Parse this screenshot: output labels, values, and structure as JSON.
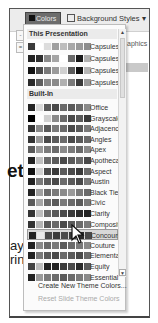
{
  "ribbon": {
    "colors_button": "Colors",
    "background_styles_button": "Background Styles",
    "graphics_partial": "aphics",
    "side_buttons": [
      "-",
      "="
    ]
  },
  "background_text": {
    "big": "et",
    "line1": "ayir",
    "line2": "ring"
  },
  "panel": {
    "section_this_presentation": "This Presentation",
    "section_built_in": "Built-In",
    "this_presentation": [
      {
        "label": "Capsules 1",
        "colors": [
          "#3a3a3a",
          "#ffffff",
          "#dcdcdc",
          "#a0a0a0",
          "#bdbdbd",
          "#a8a8a8",
          "#9a9a9a",
          "#8e8e8e"
        ]
      },
      {
        "label": "Capsules 2",
        "colors": [
          "#222222",
          "#2f2f2f",
          "#8a8a8a",
          "#a5a5a5",
          "#ffffff",
          "#6a6a6a",
          "#1a1a1a",
          "#b0b0b0"
        ]
      },
      {
        "label": "Capsules 3",
        "colors": [
          "#111111",
          "#4a4a4a",
          "#7a7a7a",
          "#9a9a9a",
          "#cfcfcf",
          "#5a5a5a",
          "#111111",
          "#b5b5b5"
        ]
      },
      {
        "label": "Capsules 4",
        "colors": [
          "#2a2a2a",
          "#5e5e5e",
          "#8a8a8a",
          "#8a8a8a",
          "#b0b0b0",
          "#7a7a7a",
          "#3a3a3a",
          "#9a9a9a"
        ]
      }
    ],
    "built_in": [
      {
        "label": "Office",
        "colors": [
          "#222222",
          "#d8d8d8",
          "#5a5a5a",
          "#4a4a4a",
          "#6a6a6a",
          "#5a5a5a",
          "#6a6a6a",
          "#8a8a8a"
        ]
      },
      {
        "label": "Grayscale",
        "colors": [
          "#000000",
          "#ffffff",
          "#d0d0d0",
          "#8a8a8a",
          "#6a6a6a",
          "#4a4a4a",
          "#5a5a5a",
          "#3a3a3a"
        ]
      },
      {
        "label": "Adjacency",
        "colors": [
          "#333333",
          "#8a8a8a",
          "#5a5a5a",
          "#7a7a7a",
          "#6a6a6a",
          "#4a4a4a",
          "#5a5a5a",
          "#7a7a7a"
        ]
      },
      {
        "label": "Angles",
        "colors": [
          "#333333",
          "#9a9a9a",
          "#4a4a4a",
          "#5a5a5a",
          "#6a6a6a",
          "#4a4a4a",
          "#5a5a5a",
          "#6a6a6a"
        ]
      },
      {
        "label": "Apex",
        "colors": [
          "#5a5a5a",
          "#9a9a9a",
          "#7a7a7a",
          "#6a6a6a",
          "#8a8a8a",
          "#7a7a7a",
          "#6a6a6a",
          "#8a8a8a"
        ]
      },
      {
        "label": "Apothecary",
        "colors": [
          "#222222",
          "#c0c0c0",
          "#6a6a6a",
          "#5a5a5a",
          "#4a4a4a",
          "#5a5a5a",
          "#6a6a6a",
          "#4a4a4a"
        ]
      },
      {
        "label": "Aspect",
        "colors": [
          "#111111",
          "#d0d0d0",
          "#4a4a4a",
          "#3a3a3a",
          "#5a5a5a",
          "#4a4a4a",
          "#3a3a3a",
          "#6a6a6a"
        ]
      },
      {
        "label": "Austin",
        "colors": [
          "#222222",
          "#7a7a7a",
          "#5a5a5a",
          "#4a4a4a",
          "#6a6a6a",
          "#5a5a5a",
          "#4a4a4a",
          "#7a7a7a"
        ]
      },
      {
        "label": "Black Tie",
        "colors": [
          "#222222",
          "#a0a0a0",
          "#6a6a6a",
          "#7a7a7a",
          "#8a8a8a",
          "#9a9a9a",
          "#7a7a7a",
          "#6a6a6a"
        ]
      },
      {
        "label": "Civic",
        "colors": [
          "#5a5a5a",
          "#a5a5a5",
          "#6a6a6a",
          "#5a5a5a",
          "#7a7a7a",
          "#6a6a6a",
          "#5a5a5a",
          "#7a7a7a"
        ]
      },
      {
        "label": "Clarity",
        "colors": [
          "#333333",
          "#bdbdbd",
          "#6a6a6a",
          "#5a5a5a",
          "#4a4a4a",
          "#3a3a3a",
          "#2a2a2a",
          "#222222"
        ]
      },
      {
        "label": "Composite",
        "colors": [
          "#333333",
          "#b5b5b5",
          "#5a5a5a",
          "#6a6a6a",
          "#4a4a4a",
          "#5a5a5a",
          "#6a6a6a",
          "#7a7a7a"
        ]
      },
      {
        "label": "Concourse",
        "colors": [
          "#222222",
          "#eaeaea",
          "#4a4a4a",
          "#3a3a3a",
          "#4a4a4a",
          "#3a3a3a",
          "#2a2a2a",
          "#4a4a4a"
        ],
        "highlighted": true
      },
      {
        "label": "Couture",
        "colors": [
          "#222222",
          "#8a8a8a",
          "#6a6a6a",
          "#7a7a7a",
          "#5a5a5a",
          "#6a6a6a",
          "#7a7a7a",
          "#8a8a8a"
        ]
      },
      {
        "label": "Elemental",
        "colors": [
          "#222222",
          "#7a7a7a",
          "#5a5a5a",
          "#4a4a4a",
          "#6a6a6a",
          "#5a5a5a",
          "#4a4a4a",
          "#6a6a6a"
        ]
      },
      {
        "label": "Equity",
        "colors": [
          "#444444",
          "#bdbdbd",
          "#222222",
          "#222222",
          "#3a3a3a",
          "#4a4a4a",
          "#2a2a2a",
          "#5a5a5a"
        ]
      },
      {
        "label": "Essential",
        "colors": [
          "#222222",
          "#9a9a9a",
          "#7a7a7a",
          "#6a6a6a",
          "#5a5a5a",
          "#6a6a6a",
          "#7a7a7a",
          "#8a8a8a"
        ]
      }
    ],
    "create_new": "Create New Theme Colors...",
    "reset": "Reset Slide Theme Colors",
    "scroll_up": "▲",
    "scroll_down": "▼"
  }
}
